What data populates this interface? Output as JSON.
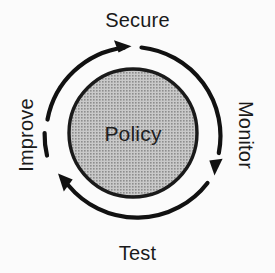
{
  "diagram": {
    "type": "cycle",
    "direction": "clockwise",
    "background_color": "#fbfbfb",
    "center_node": {
      "label": "Policy",
      "shape": "circle",
      "fill_color": "#b3b3b3",
      "fill_pattern": "halftone-dots",
      "stroke_color": "#1a1a1a",
      "center_x": 133,
      "center_y": 133,
      "radius": 64
    },
    "ring": {
      "center_x": 133,
      "center_y": 135,
      "radius": 89,
      "stroke_color": "#111111",
      "stroke_width": 4
    },
    "stages": [
      {
        "id": "secure",
        "label": "Secure",
        "position": "top",
        "rotation": 0,
        "order": 1
      },
      {
        "id": "monitor",
        "label": "Monitor",
        "position": "right",
        "rotation": 90,
        "order": 2
      },
      {
        "id": "test",
        "label": "Test",
        "position": "bottom",
        "rotation": 0,
        "order": 3
      },
      {
        "id": "improve",
        "label": "Improve",
        "position": "left",
        "rotation": -90,
        "order": 4
      }
    ],
    "arrows": [
      {
        "id": "arrow-to-secure",
        "points_to": "secure"
      },
      {
        "id": "arrow-to-monitor",
        "points_to": "monitor"
      },
      {
        "id": "arrow-to-test",
        "points_to": "test"
      },
      {
        "id": "arrow-to-improve",
        "points_to": "improve"
      }
    ]
  }
}
